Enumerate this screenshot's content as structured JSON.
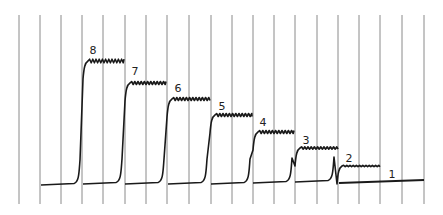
{
  "diagram": {
    "type": "kymograph-trace",
    "colors": {
      "trace": "#1a1a1a",
      "grid": "#8a8a8a",
      "background": "#ffffff"
    },
    "grid": {
      "x_positions": [
        19,
        40,
        61,
        82,
        103,
        125,
        146,
        167,
        189,
        211,
        232,
        253,
        274,
        295,
        317,
        338,
        359,
        380,
        402,
        424
      ],
      "y_top": 15,
      "y_bottom": 204
    },
    "traces": [
      {
        "label": "8",
        "start_x": 41,
        "rise_x": 80,
        "end_x": 124,
        "baseline_y": 185,
        "plateau_y": 61,
        "ripple": 3.0,
        "label_x": 93,
        "label_y": 54
      },
      {
        "label": "7",
        "start_x": 83,
        "rise_x": 122,
        "end_x": 166,
        "baseline_y": 184,
        "plateau_y": 83,
        "ripple": 2.5,
        "label_x": 135,
        "label_y": 75
      },
      {
        "label": "6",
        "start_x": 125,
        "rise_x": 164,
        "end_x": 210,
        "baseline_y": 184,
        "plateau_y": 99,
        "ripple": 2.5,
        "label_x": 178,
        "label_y": 92
      },
      {
        "label": "5",
        "start_x": 168,
        "rise_x": 207,
        "end_x": 252,
        "baseline_y": 184,
        "plateau_y": 115,
        "ripple": 2.5,
        "label_x": 222,
        "label_y": 110
      },
      {
        "label": "4",
        "start_x": 211,
        "rise_x": 250,
        "end_x": 294,
        "baseline_y": 184,
        "plateau_y": 132,
        "ripple": 2.5,
        "label_x": 263,
        "label_y": 126
      },
      {
        "label": "3",
        "start_x": 253,
        "rise_x": 292,
        "end_x": 338,
        "baseline_y": 183,
        "plateau_y": 148,
        "ripple": 2.0,
        "label_x": 306,
        "label_y": 144
      },
      {
        "label": "2",
        "start_x": 295,
        "rise_x": 334,
        "end_x": 380,
        "baseline_y": 182,
        "plateau_y": 166,
        "ripple": 1.2,
        "label_x": 349,
        "label_y": 162
      },
      {
        "label": "1",
        "start_x": 339,
        "rise_x": null,
        "end_x": 424,
        "baseline_y": 183,
        "plateau_y": 180,
        "ripple": 0,
        "label_x": 392,
        "label_y": 178
      }
    ]
  }
}
